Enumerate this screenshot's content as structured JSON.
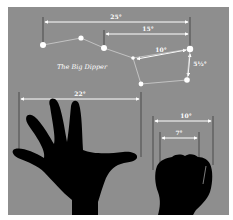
{
  "diagram": {
    "title": "The Big Dipper",
    "colors": {
      "border": "#ffffff",
      "background": "#8e8e8e",
      "lines": "#ffffff",
      "stars": "#ffffff",
      "guides": "#3a3a3a",
      "silhouette": "#000000"
    },
    "measurements": [
      {
        "id": "dipper-span",
        "label": "25°"
      },
      {
        "id": "dipper-partial",
        "label": "15°"
      },
      {
        "id": "bowl-top",
        "label": "10°"
      },
      {
        "id": "bowl-side",
        "label": "5½°"
      },
      {
        "id": "hand-span",
        "label": "22°"
      },
      {
        "id": "fist-width",
        "label": "10°"
      },
      {
        "id": "fingers-width",
        "label": "7°"
      }
    ],
    "stars": [
      {
        "name": "star-1",
        "x": 43,
        "y": 45
      },
      {
        "name": "star-2",
        "x": 81,
        "y": 38
      },
      {
        "name": "star-3",
        "x": 104,
        "y": 48
      },
      {
        "name": "star-4",
        "x": 133,
        "y": 58
      },
      {
        "name": "star-5",
        "x": 141,
        "y": 84
      },
      {
        "name": "star-6",
        "x": 187,
        "y": 80
      },
      {
        "name": "star-7",
        "x": 190,
        "y": 49
      }
    ]
  }
}
